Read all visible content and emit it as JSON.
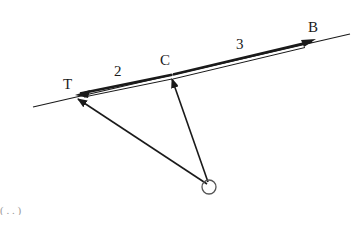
{
  "diagram": {
    "type": "vector-diagram",
    "colors": {
      "background": "#ffffff",
      "ink": "#1a1a1a",
      "circle": "#555555"
    },
    "points": {
      "T": {
        "label": "T",
        "x": 76,
        "y": 96
      },
      "C": {
        "label": "C",
        "x": 171,
        "y": 77
      },
      "B": {
        "label": "B",
        "x": 315,
        "y": 38
      },
      "O": {
        "label": "",
        "x": 209,
        "y": 187
      }
    },
    "labels": {
      "T": "T",
      "C": "C",
      "B": "B",
      "segment_TC": "2",
      "segment_CB": "3"
    },
    "line": {
      "x1": 33,
      "y1": 107,
      "x2": 350,
      "y2": 34
    },
    "cropped_fragment": "( . . )"
  }
}
